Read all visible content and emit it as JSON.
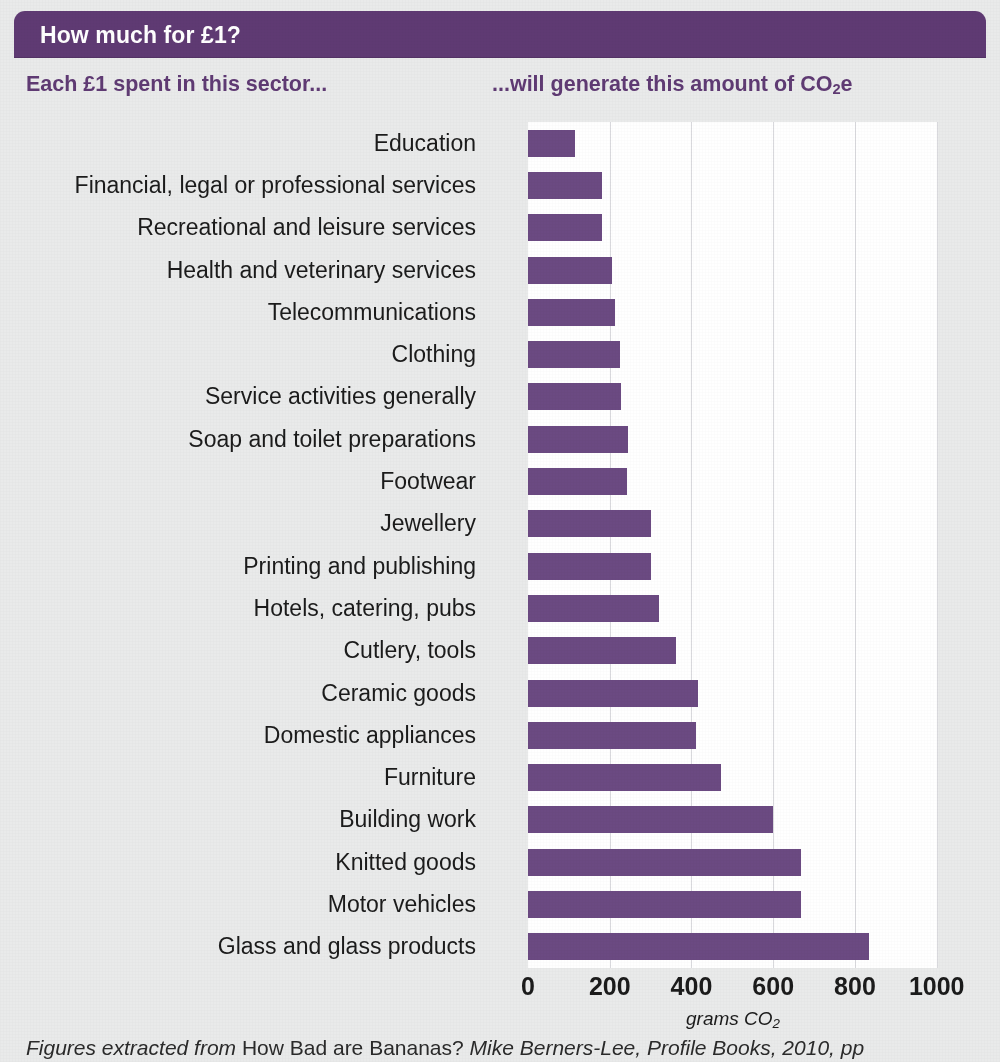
{
  "header": {
    "title": "How much for £1?",
    "bar_color": "#5f3a73"
  },
  "subheads": {
    "left": "Each £1 spent in this sector...",
    "right_prefix": "...will generate this amount of CO",
    "right_sub": "2",
    "right_suffix": "e",
    "color": "#5f3a73"
  },
  "caption": {
    "part1": "Figures extracted from ",
    "part2": "How Bad are Bananas?",
    "part3": " Mike Berners-Lee, Profile Books, 2010, pp"
  },
  "chart_data": {
    "type": "bar",
    "orientation": "horizontal",
    "title": "How much for £1?",
    "subtitle_left": "Each £1 spent in this sector...",
    "subtitle_right": "...will generate this amount of CO2e",
    "xlabel": "grams CO2",
    "ylabel": "",
    "xlim": [
      0,
      1000
    ],
    "xticks": [
      0,
      200,
      400,
      600,
      800,
      1000
    ],
    "xtick_labels": [
      "0",
      "200",
      "400",
      "600",
      "800",
      "1000"
    ],
    "grid": "vertical",
    "legend": "none",
    "bar_color": "#6b4a82",
    "categories": [
      "Education",
      "Financial, legal or professional services",
      "Recreational and leisure services",
      "Health and veterinary services",
      "Telecommunications",
      "Clothing",
      "Service activities generally",
      "Soap and toilet preparations",
      "Footwear",
      "Jewellery",
      "Printing and publishing",
      "Hotels, catering, pubs",
      "Cutlery, tools",
      "Ceramic goods",
      "Domestic appliances",
      "Furniture",
      "Building work",
      "Knitted goods",
      "Motor vehicles",
      "Glass and glass products"
    ],
    "values": [
      116,
      180,
      180,
      205,
      214,
      225,
      228,
      245,
      243,
      300,
      300,
      320,
      362,
      415,
      412,
      473,
      600,
      668,
      668,
      835
    ]
  }
}
